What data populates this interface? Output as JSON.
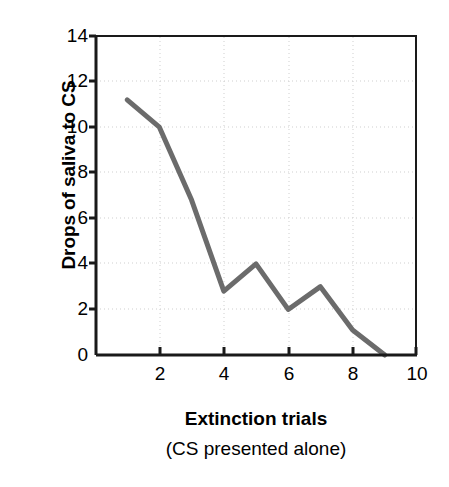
{
  "chart_data": {
    "type": "line",
    "title": "",
    "subtitle": "",
    "xlabel": "Extinction trials",
    "xlabel_sub": "(CS presented alone)",
    "ylabel": "Drops of saliva to CS",
    "xlim": [
      0,
      10
    ],
    "ylim": [
      0,
      14
    ],
    "xticks": [
      2,
      4,
      6,
      8,
      10
    ],
    "xtick_labels": [
      "2",
      "4",
      "6",
      "8",
      "10"
    ],
    "yticks": [
      0,
      2,
      4,
      6,
      8,
      10,
      12,
      14
    ],
    "ytick_labels": [
      "0",
      "2",
      "4",
      "6",
      "8",
      "10",
      "12",
      "14"
    ],
    "grid": true,
    "grid_style": "dotted",
    "grid_color": "#cfcfcf",
    "legend": null,
    "legend_position": "none",
    "line_color": "#6b6b6b",
    "line_width": 5,
    "axis_color": "#1a1a1a",
    "series": [
      {
        "name": "Drops of saliva to CS",
        "x": [
          1,
          2,
          3,
          4,
          5,
          6,
          7,
          8,
          9
        ],
        "values": [
          11.2,
          10.0,
          6.8,
          2.8,
          4.0,
          2.0,
          3.0,
          1.1,
          0.0
        ]
      }
    ]
  },
  "figure": {
    "background_color": "#ffffff",
    "plot_area": {
      "left": 95,
      "top": 36,
      "right": 417,
      "bottom": 355
    }
  }
}
